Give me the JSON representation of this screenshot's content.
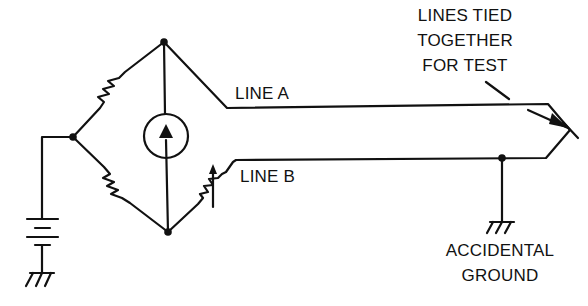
{
  "diagram": {
    "type": "circuit-schematic",
    "labels": {
      "line_a": "LINE A",
      "line_b": "LINE B",
      "tied_note_1": "LINES TIED",
      "tied_note_2": "TOGETHER",
      "tied_note_3": "FOR TEST",
      "fault_1": "ACCIDENTAL",
      "fault_2": "GROUND"
    },
    "components": [
      {
        "id": "R1",
        "kind": "resistor",
        "position": "upper-left bridge arm"
      },
      {
        "id": "R2",
        "kind": "resistor",
        "position": "lower-left bridge arm"
      },
      {
        "id": "R3",
        "kind": "variable-resistor",
        "position": "lower-right bridge arm"
      },
      {
        "id": "G",
        "kind": "galvanometer",
        "position": "bridge center"
      },
      {
        "id": "B",
        "kind": "battery",
        "position": "left, to ground"
      },
      {
        "id": "GND1",
        "kind": "ground",
        "position": "below battery"
      },
      {
        "id": "GND2",
        "kind": "ground",
        "position": "accidental ground on line B"
      }
    ],
    "colors": {
      "ink": "#111111",
      "background": "#ffffff"
    }
  }
}
